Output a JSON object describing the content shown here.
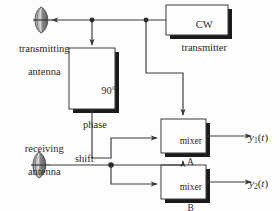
{
  "diagram": {
    "blocks": [
      {
        "id": "cw_transmitter",
        "label": "CW\ntransmitter",
        "line1": "CW",
        "line2": "transmitter"
      },
      {
        "id": "phase_shift",
        "label": "90°\nphase\nshift",
        "line1": "90°",
        "line2": "phase",
        "line3": "shift"
      },
      {
        "id": "mixer_a",
        "label": "mixer\nA",
        "line1": "mixer",
        "line2": "A"
      },
      {
        "id": "mixer_b",
        "label": "mixer\nB",
        "line1": "mixer",
        "line2": "B"
      }
    ],
    "antennas": [
      {
        "id": "transmitting_antenna",
        "line1": "transmitting",
        "line2": "antenna"
      },
      {
        "id": "receiving_antenna",
        "line1": "receiving",
        "line2": "antenna"
      }
    ],
    "outputs": [
      {
        "id": "y1",
        "var": "y",
        "sub": "1",
        "arg": "(t)",
        "t": "t"
      },
      {
        "id": "y2",
        "var": "y",
        "sub": "2",
        "arg": "(t)",
        "t": "t"
      }
    ],
    "colors": {
      "line": "#3a3a3a",
      "text": "#2b2b2b",
      "box_fill": "#fefefe",
      "shadow": "#1b1b1b",
      "antenna_fill": "#6e6e6e",
      "background": "#fdfdfb"
    }
  }
}
